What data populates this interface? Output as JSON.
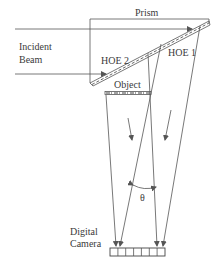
{
  "diagram": {
    "labels": {
      "prism": "Prism",
      "incident_beam_line1": "Incident",
      "incident_beam_line2": "Beam",
      "hoe2": "HOE 2",
      "hoe1": "HOE 1",
      "object": "Object",
      "theta": "θ",
      "camera_line1": "Digital",
      "camera_line2": "Camera"
    },
    "camera_pixel_count": 7,
    "colors": {
      "line": "#555555",
      "text": "#3a3a3a",
      "background": "#ffffff"
    }
  }
}
